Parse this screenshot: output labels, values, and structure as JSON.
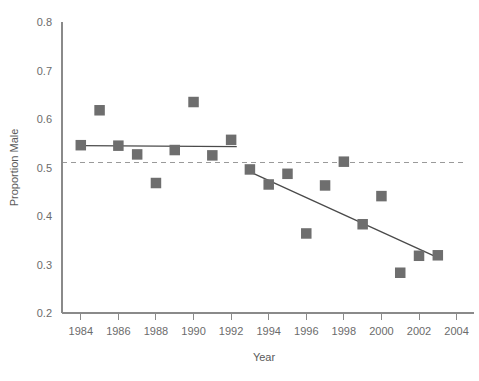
{
  "chart_data": {
    "type": "scatter",
    "title": "",
    "xlabel": "Year",
    "ylabel": "Proportion Male",
    "xlim": [
      1983,
      2004.5
    ],
    "ylim": [
      0.2,
      0.8
    ],
    "grid": false,
    "legend": "none",
    "x_ticks": [
      1984,
      1986,
      1988,
      1990,
      1992,
      1994,
      1996,
      1998,
      2000,
      2002,
      2004
    ],
    "x_tick_labels": [
      "1984",
      "1986",
      "1988",
      "1990",
      "1992",
      "1994",
      "1996",
      "1998",
      "2000",
      "2002",
      "2004"
    ],
    "y_ticks": [
      0.2,
      0.3,
      0.4,
      0.5,
      0.6,
      0.7,
      0.8
    ],
    "y_tick_labels": [
      "0.2",
      "0.3",
      "0.4",
      "0.5",
      "0.6",
      "0.7",
      "0.8"
    ],
    "marker_shape": "square",
    "marker_color": "#6e6e6e",
    "points": [
      {
        "x": 1984,
        "y": 0.546
      },
      {
        "x": 1985,
        "y": 0.618
      },
      {
        "x": 1986,
        "y": 0.545
      },
      {
        "x": 1987,
        "y": 0.527
      },
      {
        "x": 1988,
        "y": 0.468
      },
      {
        "x": 1989,
        "y": 0.536
      },
      {
        "x": 1990,
        "y": 0.635
      },
      {
        "x": 1991,
        "y": 0.525
      },
      {
        "x": 1992,
        "y": 0.557
      },
      {
        "x": 1993,
        "y": 0.496
      },
      {
        "x": 1994,
        "y": 0.465
      },
      {
        "x": 1995,
        "y": 0.487
      },
      {
        "x": 1996,
        "y": 0.364
      },
      {
        "x": 1997,
        "y": 0.463
      },
      {
        "x": 1998,
        "y": 0.512
      },
      {
        "x": 1999,
        "y": 0.383
      },
      {
        "x": 2000,
        "y": 0.441
      },
      {
        "x": 2001,
        "y": 0.283
      },
      {
        "x": 2002,
        "y": 0.318
      },
      {
        "x": 2003,
        "y": 0.319
      }
    ],
    "reference_line": {
      "name": "parity-line",
      "y": 0.51,
      "style": "dashed",
      "color": "#9a9a9a",
      "x_start": 1983,
      "x_end": 2004.5
    },
    "fit_lines": [
      {
        "name": "early-flat-fit",
        "style": "solid",
        "color": "#4a4a4a",
        "x_start": 1984,
        "x_end": 1992.3,
        "y_start": 0.545,
        "y_end": 0.543
      },
      {
        "name": "late-declining-fit",
        "style": "solid",
        "color": "#4a4a4a",
        "x_start": 1993,
        "x_end": 2003,
        "y_start": 0.491,
        "y_end": 0.314
      }
    ]
  }
}
